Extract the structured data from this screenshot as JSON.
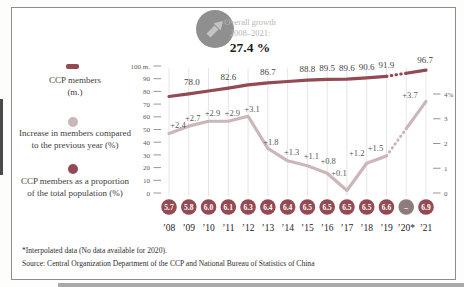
{
  "header": {
    "icon": "arrow-up-right",
    "line1": "Overall growth",
    "line2": "2008–2021:",
    "value": "27.4 %"
  },
  "legend": {
    "members": {
      "line1": "CCP members",
      "line2": "(m.)"
    },
    "increase": {
      "line1": "Increase in members compared",
      "line2": "to the previous year (%)"
    },
    "proportion": {
      "line1": "CCP members as a proportion",
      "line2": "of the total population (%)"
    }
  },
  "footnotes": {
    "note": "*Interpolated data (No data available for 2020).",
    "source": "Source: Central Organization Department of the CCP and National Bureau of Statistics of China"
  },
  "colors": {
    "maroon": "#934a52",
    "pink": "#cbb7b9",
    "grid": "#e8e4e4",
    "missing_circle": "#8d7b7d",
    "icon_gray": "#8f8f8f",
    "icon_arrow": "#c3c3c3"
  },
  "chart_data": {
    "type": "line",
    "title": "Overall growth 2008–2021: 27.4 %",
    "x_labels": [
      "’08",
      "’09",
      "’10",
      "’11",
      "’12",
      "’13",
      "’14",
      "’15",
      "’16",
      "’17",
      "’18",
      "’19",
      "’20*",
      "’21"
    ],
    "left_axis": {
      "unit": "m.",
      "labels": [
        "100 m.",
        "90",
        "80",
        "70",
        "60",
        "50",
        "40",
        "30",
        "20",
        "10",
        "0"
      ],
      "values": [
        100,
        90,
        80,
        70,
        60,
        50,
        40,
        30,
        20,
        10,
        0
      ]
    },
    "right_axis": {
      "unit": "%",
      "labels": [
        "4%",
        "3",
        "2",
        "1",
        "0"
      ],
      "values": [
        4,
        3,
        2,
        1,
        0
      ]
    },
    "grid": "vertical",
    "series": [
      {
        "id": "ccp-members",
        "name": "CCP members (m.)",
        "axis": "left",
        "color": "#934a52",
        "values": [
          76.0,
          78.0,
          80.3,
          82.6,
          85.1,
          86.7,
          87.8,
          88.8,
          89.5,
          89.6,
          90.6,
          91.9,
          94.3,
          96.7
        ],
        "labels": [
          "",
          "78.0",
          "",
          "82.6",
          "",
          "86.7",
          "",
          "88.8",
          "89.5",
          "89.6",
          "90.6",
          "91.9",
          "",
          "96.7"
        ],
        "dashed_segment": [
          11,
          12
        ],
        "interpolated_index": 12,
        "label_default_offset": [
          0,
          -8
        ],
        "label_offsets": {
          "1": [
            3,
            -9
          ],
          "13": [
            -1,
            -7
          ]
        }
      },
      {
        "id": "yearly-increase",
        "name": "Increase in members compared to the previous year (%)",
        "axis": "right",
        "color": "#cbb7b9",
        "values": [
          2.4,
          2.7,
          2.9,
          2.9,
          3.1,
          1.8,
          1.3,
          1.1,
          0.8,
          0.1,
          1.2,
          1.5,
          2.6,
          3.7
        ],
        "labels": [
          "+2.4",
          "+2.7",
          "+2.9",
          "+2.9",
          "+3.1",
          "+1.8",
          "+1.3",
          "+1.1",
          "+0.8",
          "+0.1",
          "+1.2",
          "+1.5",
          "",
          "+3.7"
        ],
        "dashed_segment": [
          11,
          12
        ],
        "interpolated_index": 12,
        "label_default_offset": [
          4,
          -5
        ],
        "label_offsets": {
          "0": [
            9,
            -6
          ],
          "4": [
            4,
            -4
          ],
          "5": [
            3,
            -3
          ],
          "6": [
            4,
            -6
          ],
          "7": [
            4,
            -7
          ],
          "8": [
            1,
            -9
          ],
          "9": [
            -8,
            -15
          ],
          "10": [
            -10,
            -7
          ],
          "11": [
            -11,
            -5
          ],
          "13": [
            -16,
            -3
          ]
        }
      }
    ],
    "proportion_row": {
      "name": "CCP members as a proportion of the total population (%)",
      "values": [
        "5.7",
        "5.8",
        "6.0",
        "6.1",
        "6.3",
        "6.4",
        "6.4",
        "6.5",
        "6.5",
        "6.5",
        "6.5",
        "6.6",
        "–",
        "6.9"
      ],
      "missing_index": 12
    }
  }
}
